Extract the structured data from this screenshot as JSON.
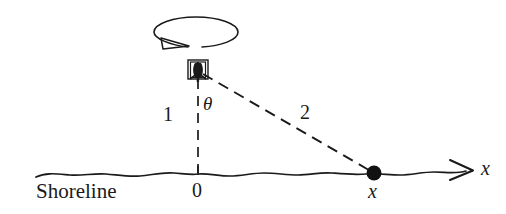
{
  "figure": {
    "background_color": "#ffffff",
    "ink_color": "#1a1a1a",
    "width": 506,
    "height": 214
  },
  "labels": {
    "distance_vertical": "1",
    "distance_beam": "2",
    "angle": "θ",
    "origin": "0",
    "point_on_shore": "x",
    "axis": "x",
    "shoreline": "Shoreline"
  },
  "geometry": {
    "beacon": {
      "x": 198,
      "y": 70
    },
    "origin": {
      "x": 198,
      "y": 173
    },
    "point": {
      "x": 374,
      "y": 173
    },
    "axis_arrow_tip": {
      "x": 472,
      "y": 170
    },
    "shoreline_left": {
      "x": 36,
      "y": 174
    },
    "rotation_ellipse": {
      "cx": 196,
      "cy": 32,
      "rx": 42,
      "ry": 15
    }
  },
  "elements": {
    "vertical_segment_style": "dashed",
    "beam_segment_style": "dashed",
    "shoreline_style": "wavy-solid",
    "axis_style": "solid-with-arrowhead",
    "point_marker": "filled-dot",
    "rotation_indicator": "ellipse-with-arrowhead"
  }
}
